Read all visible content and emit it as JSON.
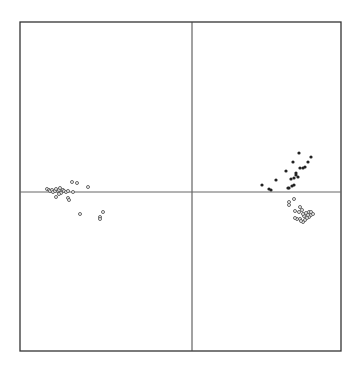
{
  "chart_data": {
    "type": "scatter",
    "title": "",
    "xlabel": "",
    "ylabel": "",
    "grid": false,
    "legend": null,
    "frame_px": {
      "left": 20,
      "top": 22,
      "right": 341,
      "bottom": 351
    },
    "origin_px": {
      "x": 192,
      "y": 192
    },
    "reference_lines": [
      "x=0 vertical",
      "y=0 horizontal"
    ],
    "series": [
      {
        "name": "left-cluster",
        "marker": "open-circle",
        "points_px": [
          [
            47,
            189
          ],
          [
            49,
            190
          ],
          [
            50,
            191
          ],
          [
            52,
            190
          ],
          [
            53,
            192
          ],
          [
            55,
            191
          ],
          [
            56,
            189
          ],
          [
            58,
            191
          ],
          [
            59,
            190
          ],
          [
            60,
            188
          ],
          [
            61,
            193
          ],
          [
            63,
            190
          ],
          [
            64,
            191
          ],
          [
            66,
            192
          ],
          [
            68,
            191
          ],
          [
            56,
            197
          ],
          [
            59,
            194
          ],
          [
            68,
            198
          ],
          [
            69,
            200
          ],
          [
            72,
            182
          ],
          [
            77,
            183
          ],
          [
            73,
            192
          ],
          [
            88,
            187
          ],
          [
            80,
            214
          ],
          [
            100,
            217
          ],
          [
            100,
            219
          ],
          [
            103,
            212
          ]
        ]
      },
      {
        "name": "right-upper-cluster",
        "marker": "filled-circle",
        "points_px": [
          [
            262,
            185
          ],
          [
            269,
            189
          ],
          [
            271,
            190
          ],
          [
            276,
            180
          ],
          [
            286,
            171
          ],
          [
            293,
            162
          ],
          [
            299,
            153
          ],
          [
            311,
            157
          ],
          [
            308,
            162
          ],
          [
            305,
            167
          ],
          [
            303,
            168
          ],
          [
            300,
            168
          ],
          [
            296,
            173
          ],
          [
            298,
            177
          ],
          [
            296,
            175
          ],
          [
            294,
            178
          ],
          [
            291,
            179
          ],
          [
            289,
            188
          ],
          [
            288,
            188
          ],
          [
            292,
            186
          ],
          [
            294,
            185
          ]
        ]
      },
      {
        "name": "right-lower-cluster",
        "marker": "open-circle",
        "points_px": [
          [
            289,
            202
          ],
          [
            289,
            205
          ],
          [
            294,
            199
          ],
          [
            300,
            207
          ],
          [
            295,
            211
          ],
          [
            299,
            212
          ],
          [
            302,
            210
          ],
          [
            304,
            216
          ],
          [
            306,
            213
          ],
          [
            309,
            212
          ],
          [
            311,
            212
          ],
          [
            311,
            215
          ],
          [
            313,
            214
          ],
          [
            309,
            217
          ],
          [
            307,
            218
          ],
          [
            305,
            220
          ],
          [
            303,
            222
          ],
          [
            300,
            219
          ],
          [
            297,
            219
          ],
          [
            295,
            218
          ],
          [
            301,
            221
          ],
          [
            303,
            214
          ],
          [
            308,
            215
          ]
        ]
      }
    ]
  },
  "colors": {
    "frame": "#333333",
    "axis_lines": "#555555",
    "open_marker_stroke": "#555555",
    "filled_marker": "#222222",
    "background": "#ffffff"
  }
}
